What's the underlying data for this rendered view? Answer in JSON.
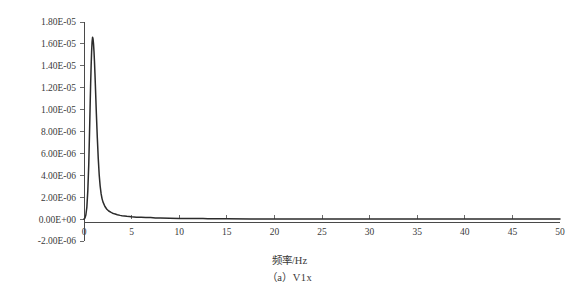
{
  "figure": {
    "caption": "（a）V1x",
    "background_color": "#ffffff",
    "line_color": "#2b2b2b",
    "axis_color": "#4a4a4a"
  },
  "chart_data": {
    "type": "line",
    "title": "",
    "xlabel": "频率/Hz",
    "ylabel_prefix": "功率谱密度/（mm",
    "ylabel_sup": "2",
    "ylabel_suffix": "/Hz）",
    "ylabel": "功率谱密度/（mm2/Hz）",
    "xlim": [
      0,
      50
    ],
    "ylim": [
      -2e-06,
      1.8e-05
    ],
    "grid": false,
    "legend": false,
    "xticks": [
      0,
      5,
      10,
      15,
      20,
      25,
      30,
      35,
      40,
      45,
      50
    ],
    "xtick_labels": [
      "0",
      "5",
      "10",
      "15",
      "20",
      "25",
      "30",
      "35",
      "40",
      "45",
      "50"
    ],
    "yticks": [
      -2e-06,
      0.0,
      2e-06,
      4e-06,
      6e-06,
      8e-06,
      1e-05,
      1.2e-05,
      1.4e-05,
      1.6e-05,
      1.8e-05
    ],
    "ytick_labels": [
      "-2.00E-06",
      "0.00E+00",
      "2.00E-06",
      "4.00E-06",
      "6.00E-06",
      "8.00E-06",
      "1.00E-05",
      "1.20E-05",
      "1.40E-05",
      "1.60E-05",
      "1.80E-05"
    ],
    "series": [
      {
        "name": "V1x",
        "x": [
          0.0,
          0.1,
          0.2,
          0.3,
          0.4,
          0.5,
          0.6,
          0.65,
          0.7,
          0.75,
          0.8,
          0.85,
          0.9,
          0.95,
          1.0,
          1.05,
          1.1,
          1.15,
          1.2,
          1.3,
          1.4,
          1.5,
          1.6,
          1.7,
          1.8,
          1.9,
          2.0,
          2.2,
          2.4,
          2.6,
          2.8,
          3.0,
          3.2,
          3.5,
          3.8,
          4.0,
          4.5,
          5.0,
          5.5,
          6.0,
          6.5,
          7.0,
          7.5,
          8.0,
          9.0,
          10.0,
          11.0,
          12.0,
          12.5,
          13.0,
          14.0,
          15.0,
          17.5,
          20.0,
          22.5,
          25.0,
          27.5,
          30.0,
          32.5,
          35.0,
          37.5,
          40.0,
          42.5,
          45.0,
          47.5,
          50.0
        ],
        "y": [
          0.0,
          1e-07,
          4e-07,
          1.1e-06,
          2.6e-06,
          5e-06,
          8.6e-06,
          1.06e-05,
          1.24e-05,
          1.4e-05,
          1.53e-05,
          1.62e-05,
          1.66e-05,
          1.645e-05,
          1.6e-05,
          1.53e-05,
          1.44e-05,
          1.33e-05,
          1.21e-05,
          9.6e-06,
          7.4e-06,
          5.5e-06,
          4e-06,
          3e-06,
          2.3e-06,
          1.85e-06,
          1.55e-06,
          1.15e-06,
          9e-07,
          7.4e-07,
          6.3e-07,
          5.4e-07,
          4.8e-07,
          4e-07,
          3.4e-07,
          3.1e-07,
          2.5e-07,
          2.1e-07,
          1.8e-07,
          1.6e-07,
          1.45e-07,
          1.35e-07,
          1.1e-07,
          9e-08,
          7e-08,
          6e-08,
          5.5e-08,
          5e-08,
          4.5e-08,
          3e-08,
          2.5e-08,
          2.2e-08,
          1.8e-08,
          1.5e-08,
          1.3e-08,
          1.2e-08,
          1.1e-08,
          1e-08,
          9e-09,
          9e-09,
          8e-09,
          8e-09,
          7e-09,
          7e-09,
          6e-09,
          6e-09
        ],
        "peak_x": 0.9,
        "peak_y": 1.66e-05
      }
    ]
  }
}
